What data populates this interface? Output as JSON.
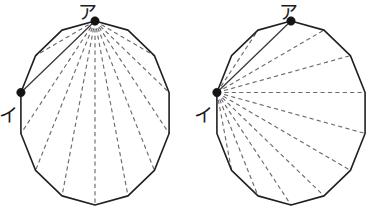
{
  "figure": {
    "background_color": "#ffffff",
    "outline_color": "#231f20",
    "dashed_color": "#6d6a70",
    "solid_diagonal_color": "#3a3639",
    "vertex_dot_color": "#151314",
    "polygon_sides": 14,
    "panels": [
      {
        "name": "left-polygon",
        "fan_origin_label": "ア",
        "fan_origin_vertex_index": 0,
        "other_label": "イ",
        "other_vertex_index": 11,
        "dashed_diagonal_count": 10,
        "solid_diagonal_count": 1,
        "center": {
          "x": 95,
          "y": 113
        },
        "radius_x": 76,
        "radius_y": 92,
        "rotation_deg": 0,
        "labels": [
          {
            "text": "ア",
            "x": 87,
            "y": 19,
            "anchor": "middle"
          },
          {
            "text": "イ",
            "x": 8,
            "y": 122,
            "anchor": "middle"
          }
        ]
      },
      {
        "name": "right-polygon",
        "fan_origin_label": "イ",
        "fan_origin_vertex_index": 11,
        "other_label": "ア",
        "other_vertex_index": 0,
        "dashed_diagonal_count": 10,
        "solid_diagonal_count": 1,
        "center": {
          "x": 291,
          "y": 113
        },
        "radius_x": 76,
        "radius_y": 92,
        "rotation_deg": 0,
        "labels": [
          {
            "text": "ア",
            "x": 288,
            "y": 19,
            "anchor": "middle"
          },
          {
            "text": "イ",
            "x": 203,
            "y": 122,
            "anchor": "middle"
          }
        ]
      }
    ]
  }
}
